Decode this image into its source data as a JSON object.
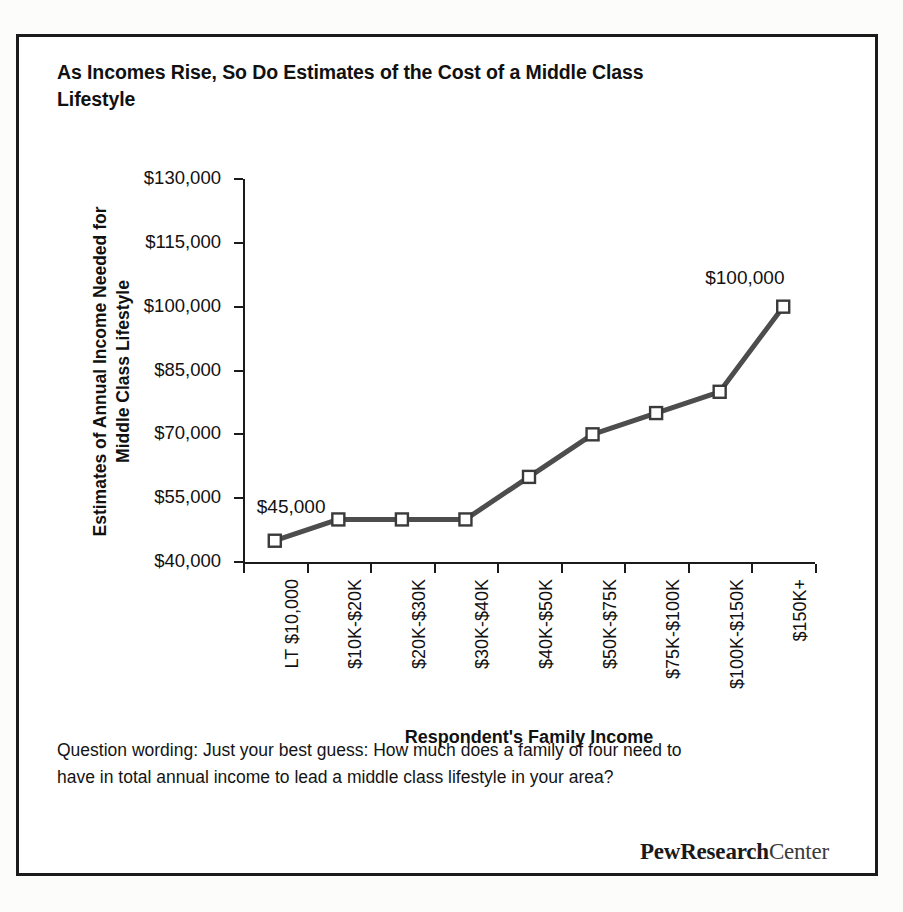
{
  "title": "As Incomes Rise, So Do Estimates of the Cost of a Middle Class Lifestyle",
  "footnote": "Question wording: Just your best guess: How much does a family of four need to have in total annual income to lead a middle class lifestyle in your area?",
  "logo": {
    "bold": "PewResearch",
    "light": "Center"
  },
  "colors": {
    "line": "#4d4d4d",
    "marker_fill": "#ffffff",
    "marker_stroke": "#3a3a3a",
    "axis": "#1b1b1b",
    "text": "#111111",
    "border": "#1b1b1b"
  },
  "chart_data": {
    "type": "line",
    "title": "As Incomes Rise, So Do Estimates of the Cost of a Middle Class Lifestyle",
    "xlabel": "Respondent's Family Income",
    "ylabel": "Estimates of Annual Income Needed for Middle Class Lifestyle",
    "categories": [
      "LT $10,000",
      "$10K-$20K",
      "$20K-$30K",
      "$30K-$40K",
      "$40K-$50K",
      "$50K-$75K",
      "$75K-$100K",
      "$100K-$150K",
      "$150K+"
    ],
    "values": [
      45000,
      50000,
      50000,
      50000,
      60000,
      70000,
      75000,
      80000,
      100000
    ],
    "ylim": [
      40000,
      130000
    ],
    "ytick_values": [
      40000,
      55000,
      70000,
      85000,
      100000,
      115000,
      130000
    ],
    "ytick_labels": [
      "$40,000",
      "$55,000",
      "$70,000",
      "$85,000",
      "$100,000",
      "$115,000",
      "$130,000"
    ],
    "grid": false,
    "legend": false,
    "marker": "square-open",
    "point_labels": [
      {
        "index": 0,
        "text": "$45,000"
      },
      {
        "index": 8,
        "text": "$100,000"
      }
    ]
  }
}
